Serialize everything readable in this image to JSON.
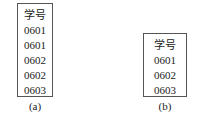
{
  "table_a": {
    "header": "学号",
    "rows": [
      "0601",
      "0601",
      "0602",
      "0602",
      "0603"
    ],
    "caption": "(a)"
  },
  "table_b": {
    "header": "学号",
    "rows": [
      "0601",
      "0602",
      "0603"
    ],
    "caption": "(b)"
  }
}
